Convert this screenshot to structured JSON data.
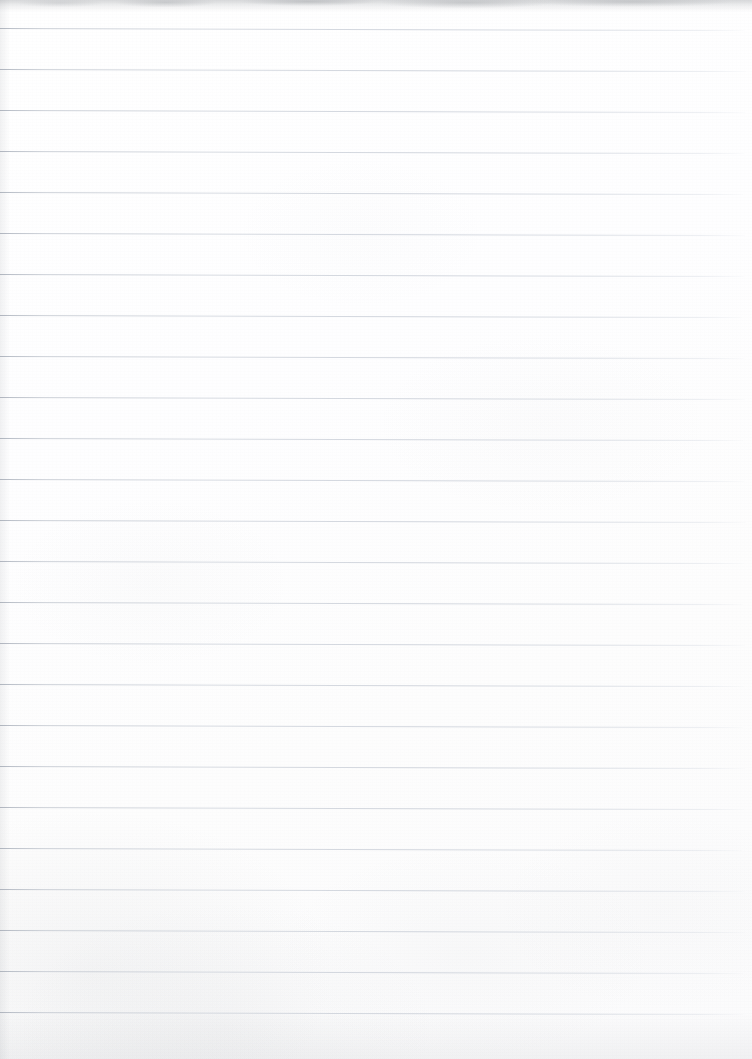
{
  "document": {
    "type": "scanned-ruled-notebook-page",
    "title": "Blank lined notebook page",
    "content_text": "",
    "has_handwriting": false,
    "has_printed_text": false,
    "page_width": 752,
    "page_height": 1059
  },
  "paper": {
    "background_color": "#ffffff",
    "tint_color": "#fdfdfd",
    "texture": "subtle mottled scan grain, heavier toward the lower-left",
    "top_edge_shadow_color": "#9a9ea4",
    "top_edge_shadow_height": 12
  },
  "rules": {
    "label": "horizontal ruled lines",
    "color": "#c9ced6",
    "left_end_color": "#b0b6c0",
    "thickness": 1,
    "spacing": 41,
    "first_line_y": 28,
    "last_line_y": 1015,
    "count": 25,
    "x_start": 0,
    "x_end": 744,
    "skew_degrees": 0.16,
    "has_vertical_margin_rule": false,
    "positions": [
      28,
      69,
      110,
      151,
      192,
      233,
      274,
      315,
      356,
      397,
      438,
      479,
      520,
      561,
      602,
      643,
      684,
      725,
      766,
      807,
      848,
      889,
      930,
      971,
      1012
    ],
    "widths": [
      744,
      746,
      745,
      744,
      743,
      745,
      744,
      742,
      744,
      745,
      743,
      744,
      746,
      744,
      743,
      745,
      744,
      743,
      745,
      744,
      742,
      744,
      745,
      743,
      744
    ]
  }
}
